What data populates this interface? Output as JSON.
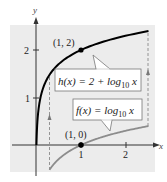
{
  "chart_data": {
    "type": "line",
    "title": "",
    "xlabel": "x",
    "ylabel": "y",
    "x_ticks": [
      "1",
      "2"
    ],
    "y_ticks": [
      "1",
      "2"
    ],
    "xlim": [
      -0.5,
      2.6
    ],
    "ylim": [
      -0.6,
      2.6
    ],
    "grid": false,
    "legend": "callout labels",
    "series": [
      {
        "name": "h(x) = 2 + log10 x",
        "label_prefix": "h(x) = 2 + log",
        "label_sub": "10",
        "label_suffix": " x",
        "color": "#000000",
        "x": [
          0.01,
          0.05,
          0.1,
          0.2,
          0.3,
          0.5,
          0.75,
          1,
          1.5,
          2,
          2.5
        ],
        "values": [
          0,
          0.699,
          1,
          1.301,
          1.477,
          1.699,
          1.875,
          2,
          2.176,
          2.301,
          2.398
        ]
      },
      {
        "name": "f(x) = log10 x",
        "label_prefix": "f(x) = log",
        "label_sub": "10",
        "label_suffix": " x",
        "color": "#8c8c8c",
        "x": [
          0.3,
          0.5,
          0.75,
          1,
          1.5,
          2,
          2.5
        ],
        "values": [
          -0.523,
          -0.301,
          -0.125,
          0,
          0.176,
          0.301,
          0.398
        ]
      }
    ],
    "annotations": [
      {
        "text": "(1, 2)",
        "x": 1,
        "y": 2,
        "marker": "point"
      },
      {
        "text": "(1, 0)",
        "x": 1,
        "y": 0,
        "marker": "point"
      }
    ],
    "shift_arrows": {
      "style": "dashed",
      "from_x": [
        0.3,
        2.5
      ],
      "description": "vertical shift up 2 units"
    }
  },
  "labels": {
    "x_axis": "x",
    "y_axis": "y",
    "tick_x1": "1",
    "tick_x2": "2",
    "tick_y1": "1",
    "tick_y2": "2",
    "point_h": "(1, 2)",
    "point_f": "(1, 0)",
    "h_label_prefix": "h(x) = 2 + log",
    "h_label_sub": "10",
    "h_label_suffix": " x",
    "f_label_prefix": "f(x) = log",
    "f_label_sub": "10",
    "f_label_suffix": " x"
  },
  "colors": {
    "background_panel": "#ececec",
    "axis": "#333333",
    "h_curve": "#000000",
    "f_curve": "#8c8c8c",
    "dashed": "#8a8a8a",
    "label_box_border": "#777777"
  }
}
